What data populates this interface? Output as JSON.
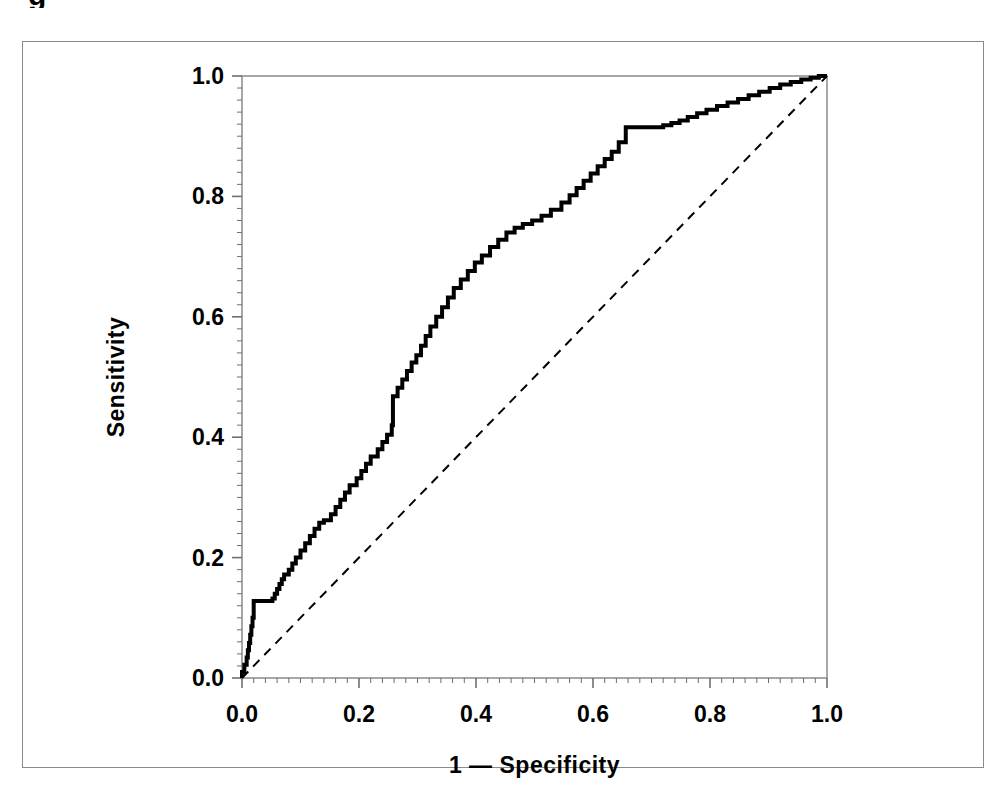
{
  "figure": {
    "caption_remnant": "g",
    "background_color": "#ffffff",
    "frame_color": "#8a8a8a",
    "curve_color": "#000000",
    "reference_line_color": "#000000"
  },
  "chart_data": {
    "type": "line",
    "title": "",
    "subtitle": "",
    "xlabel": "1 — Specificity",
    "ylabel": "Sensitivity",
    "xlim": [
      0.0,
      1.0
    ],
    "ylim": [
      0.0,
      1.0
    ],
    "xticks": [
      0.0,
      0.2,
      0.4,
      0.6,
      0.8,
      1.0
    ],
    "yticks": [
      0.0,
      0.2,
      0.4,
      0.6,
      0.8,
      1.0
    ],
    "xtick_labels": [
      "0.0",
      "0.2",
      "0.4",
      "0.6",
      "0.8",
      "1.0"
    ],
    "ytick_labels": [
      "0.0",
      "0.2",
      "0.4",
      "0.6",
      "0.8",
      "1.0"
    ],
    "minor_tick_interval": 0.02,
    "grid": false,
    "legend": null,
    "legend_position": "none",
    "series": [
      {
        "name": "ROC curve",
        "style": "step",
        "linewidth": 4,
        "dash": "solid",
        "x": [
          0.0,
          0.0,
          0.004,
          0.004,
          0.008,
          0.008,
          0.01,
          0.01,
          0.012,
          0.012,
          0.014,
          0.014,
          0.016,
          0.016,
          0.018,
          0.018,
          0.02,
          0.02,
          0.052,
          0.052,
          0.056,
          0.056,
          0.06,
          0.06,
          0.064,
          0.064,
          0.068,
          0.068,
          0.072,
          0.072,
          0.08,
          0.08,
          0.086,
          0.086,
          0.092,
          0.092,
          0.1,
          0.1,
          0.108,
          0.108,
          0.116,
          0.116,
          0.124,
          0.124,
          0.132,
          0.132,
          0.14,
          0.14,
          0.152,
          0.152,
          0.16,
          0.16,
          0.168,
          0.168,
          0.176,
          0.176,
          0.184,
          0.184,
          0.196,
          0.196,
          0.204,
          0.204,
          0.212,
          0.212,
          0.22,
          0.22,
          0.232,
          0.232,
          0.24,
          0.24,
          0.248,
          0.248,
          0.256,
          0.256,
          0.258,
          0.258,
          0.266,
          0.266,
          0.274,
          0.274,
          0.282,
          0.282,
          0.29,
          0.29,
          0.298,
          0.298,
          0.306,
          0.306,
          0.314,
          0.314,
          0.322,
          0.322,
          0.332,
          0.332,
          0.342,
          0.342,
          0.352,
          0.352,
          0.362,
          0.362,
          0.374,
          0.374,
          0.386,
          0.386,
          0.398,
          0.398,
          0.41,
          0.41,
          0.424,
          0.424,
          0.438,
          0.438,
          0.452,
          0.452,
          0.466,
          0.466,
          0.48,
          0.48,
          0.496,
          0.496,
          0.512,
          0.512,
          0.528,
          0.528,
          0.546,
          0.546,
          0.56,
          0.56,
          0.572,
          0.572,
          0.584,
          0.584,
          0.596,
          0.596,
          0.608,
          0.608,
          0.62,
          0.62,
          0.632,
          0.632,
          0.644,
          0.644,
          0.656,
          0.656,
          0.72,
          0.72,
          0.734,
          0.734,
          0.748,
          0.748,
          0.762,
          0.762,
          0.778,
          0.778,
          0.794,
          0.794,
          0.812,
          0.812,
          0.83,
          0.83,
          0.848,
          0.848,
          0.866,
          0.866,
          0.884,
          0.884,
          0.902,
          0.902,
          0.92,
          0.92,
          0.938,
          0.938,
          0.956,
          0.956,
          0.972,
          0.972,
          0.986,
          0.986,
          1.0
        ],
        "y": [
          0.0,
          0.01,
          0.01,
          0.022,
          0.022,
          0.034,
          0.034,
          0.046,
          0.046,
          0.058,
          0.058,
          0.072,
          0.072,
          0.086,
          0.086,
          0.1,
          0.1,
          0.128,
          0.128,
          0.132,
          0.132,
          0.14,
          0.14,
          0.148,
          0.148,
          0.156,
          0.156,
          0.164,
          0.164,
          0.172,
          0.172,
          0.18,
          0.18,
          0.19,
          0.19,
          0.2,
          0.2,
          0.212,
          0.212,
          0.224,
          0.224,
          0.236,
          0.236,
          0.248,
          0.248,
          0.258,
          0.258,
          0.262,
          0.262,
          0.272,
          0.272,
          0.284,
          0.284,
          0.296,
          0.296,
          0.308,
          0.308,
          0.32,
          0.32,
          0.332,
          0.332,
          0.344,
          0.344,
          0.356,
          0.356,
          0.368,
          0.368,
          0.38,
          0.38,
          0.392,
          0.392,
          0.404,
          0.404,
          0.42,
          0.42,
          0.468,
          0.468,
          0.482,
          0.482,
          0.496,
          0.496,
          0.51,
          0.51,
          0.524,
          0.524,
          0.536,
          0.536,
          0.552,
          0.552,
          0.568,
          0.568,
          0.584,
          0.584,
          0.6,
          0.6,
          0.616,
          0.616,
          0.632,
          0.632,
          0.648,
          0.648,
          0.662,
          0.662,
          0.676,
          0.676,
          0.69,
          0.69,
          0.702,
          0.702,
          0.716,
          0.716,
          0.728,
          0.728,
          0.74,
          0.74,
          0.748,
          0.748,
          0.754,
          0.754,
          0.76,
          0.76,
          0.768,
          0.768,
          0.778,
          0.778,
          0.79,
          0.79,
          0.802,
          0.802,
          0.814,
          0.814,
          0.826,
          0.826,
          0.838,
          0.838,
          0.85,
          0.85,
          0.862,
          0.862,
          0.874,
          0.874,
          0.89,
          0.89,
          0.915,
          0.915,
          0.918,
          0.918,
          0.922,
          0.922,
          0.926,
          0.926,
          0.932,
          0.932,
          0.938,
          0.938,
          0.944,
          0.944,
          0.95,
          0.95,
          0.956,
          0.956,
          0.962,
          0.962,
          0.968,
          0.968,
          0.974,
          0.974,
          0.98,
          0.98,
          0.986,
          0.986,
          0.99,
          0.99,
          0.994,
          0.994,
          0.997,
          0.997,
          1.0,
          1.0
        ]
      },
      {
        "name": "Reference diagonal",
        "style": "line",
        "linewidth": 2,
        "dash": "dashed",
        "x": [
          0.0,
          1.0
        ],
        "y": [
          0.0,
          1.0
        ]
      }
    ]
  }
}
